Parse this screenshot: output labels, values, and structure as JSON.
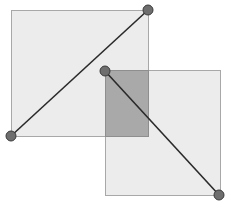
{
  "diagram": {
    "width": 227,
    "height": 204,
    "colors": {
      "rect_fill": "#ececec",
      "rect_stroke": "#a8a8a8",
      "overlap_fill": "#a9a9a9",
      "line": "#2a2a2a",
      "handle_fill": "#6e6e6e",
      "handle_stroke": "#3a3a3a"
    },
    "rectangles": [
      {
        "id": "rect-1",
        "x": 11,
        "y": 10,
        "width": 137,
        "height": 126
      },
      {
        "id": "rect-2",
        "x": 105,
        "y": 70,
        "width": 115,
        "height": 125
      }
    ],
    "overlap": {
      "x": 105,
      "y": 70,
      "width": 43,
      "height": 66
    },
    "diagonals": [
      {
        "id": "diagonal-1",
        "x1": 11,
        "y1": 136,
        "x2": 148,
        "y2": 10
      },
      {
        "id": "diagonal-2",
        "x1": 105,
        "y1": 71,
        "x2": 219,
        "y2": 195
      }
    ],
    "handles": [
      {
        "id": "handle-rect1-bottom-left",
        "cx": 11,
        "cy": 136,
        "r": 5
      },
      {
        "id": "handle-rect1-top-right",
        "cx": 148,
        "cy": 10,
        "r": 5
      },
      {
        "id": "handle-rect2-top-left",
        "cx": 105,
        "cy": 71,
        "r": 5
      },
      {
        "id": "handle-rect2-bottom-right",
        "cx": 219,
        "cy": 195,
        "r": 5
      }
    ]
  }
}
